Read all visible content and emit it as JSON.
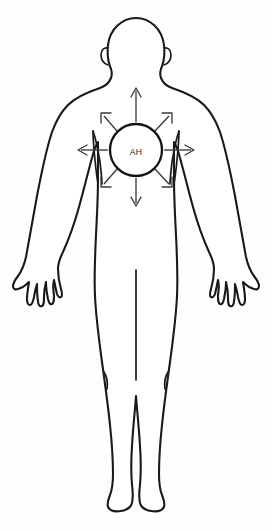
{
  "diagram": {
    "title": "Anterior human body silhouette with central chest marker and radiating arrows",
    "view": "anterior",
    "background_color": "#fefefe",
    "outline_color": "#1a1a1a",
    "arrow_color": "#3a3a3a",
    "marker": {
      "label": "AH",
      "shape": "circle",
      "center_x": 136,
      "center_y": 150,
      "radius": 26,
      "fill_color": "#ffffff",
      "stroke_color": "#141414",
      "location": "central chest / sternum"
    },
    "arrows": {
      "count": 8,
      "meaning": "radiating outward from the central marker",
      "items": [
        {
          "name": "arrow-up",
          "direction": "up",
          "angle_deg": 270,
          "tip_x": 136,
          "tip_y": 88
        },
        {
          "name": "arrow-up-right",
          "direction": "up-right",
          "angle_deg": 315,
          "tip_x": 172,
          "tip_y": 113
        },
        {
          "name": "arrow-right",
          "direction": "right",
          "angle_deg": 0,
          "tip_x": 194,
          "tip_y": 150
        },
        {
          "name": "arrow-down-right",
          "direction": "down-right",
          "angle_deg": 45,
          "tip_x": 172,
          "tip_y": 187
        },
        {
          "name": "arrow-down",
          "direction": "down",
          "angle_deg": 90,
          "tip_x": 136,
          "tip_y": 206
        },
        {
          "name": "arrow-down-left",
          "direction": "down-left",
          "angle_deg": 135,
          "tip_x": 101,
          "tip_y": 187
        },
        {
          "name": "arrow-left",
          "direction": "left",
          "angle_deg": 180,
          "tip_x": 78,
          "tip_y": 150
        },
        {
          "name": "arrow-up-left",
          "direction": "up-left",
          "angle_deg": 225,
          "tip_x": 101,
          "tip_y": 113
        }
      ]
    },
    "body_parts": [
      "head",
      "ears",
      "neck",
      "shoulders",
      "torso",
      "chest",
      "arms",
      "hands",
      "fingers",
      "hips",
      "legs",
      "knees",
      "feet"
    ]
  }
}
